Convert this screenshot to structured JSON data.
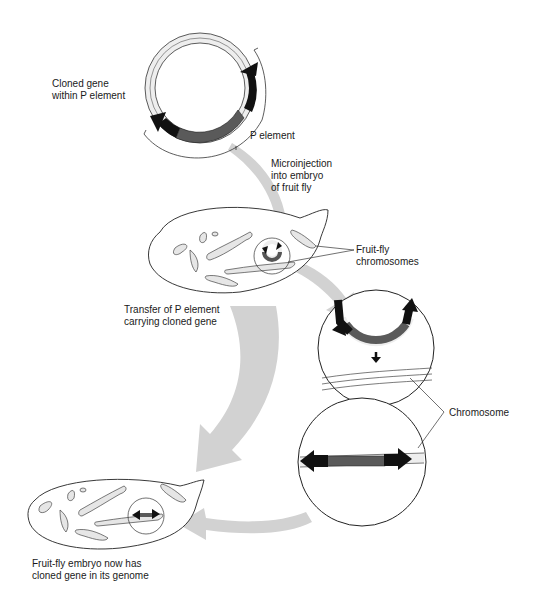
{
  "labels": {
    "cloned_gene": "Cloned gene\nwithin P element",
    "p_element": "P element",
    "microinjection": "Microinjection\ninto embryo\nof fruit fly",
    "fruitfly_chromosomes": "Fruit-fly\nchromosomes",
    "transfer": "Transfer of P element\ncarrying cloned gene",
    "chromosome": "Chromosome",
    "result": "Fruit-fly embryo now has\ncloned gene in its genome"
  },
  "colors": {
    "arrow_gray": "#cfcfcf",
    "gene_dark": "#5a5a5a",
    "p_end_black": "#111111",
    "strand_light": "#e6e6e6",
    "outline": "#222222"
  }
}
